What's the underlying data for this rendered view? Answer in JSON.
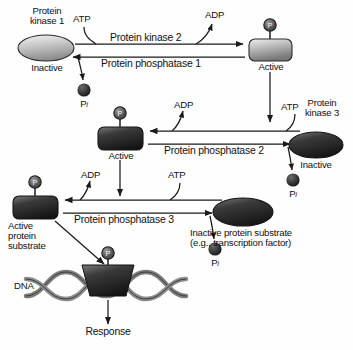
{
  "diagram": {
    "type": "signal-transduction-cascade",
    "background_color": "#fefefe",
    "ink_color": "#111111"
  },
  "nodes": {
    "kinase1_inactive": {
      "name": "Protein kinase 1",
      "name_line1": "Protein",
      "name_line2": "kinase 1",
      "state": "Inactive",
      "shape": "ellipse",
      "fill": "light-gray-gradient"
    },
    "kinase1_active": {
      "state": "Active",
      "shape": "rounded-rectangle",
      "fill": "gray-gradient",
      "phosphate_badge": "P"
    },
    "kinase2_active": {
      "state": "Active",
      "shape": "rounded-rectangle",
      "fill": "dark-gradient",
      "phosphate_badge": "P"
    },
    "kinase3_inactive": {
      "name": "Protein kinase 3",
      "name_line1": "Protein",
      "name_line2": "kinase 3",
      "state": "Inactive",
      "shape": "ellipse",
      "fill": "dark-gradient"
    },
    "substrate_active": {
      "state_line1": "Active",
      "state_line2": "protein",
      "state_line3": "substrate",
      "shape": "rounded-rectangle",
      "fill": "dark-gradient",
      "phosphate_badge": "P"
    },
    "substrate_inactive": {
      "label_line1": "Inactive protein substrate",
      "label_line2": "(e.g., transcription factor)",
      "shape": "ellipse",
      "fill": "dark-gradient"
    },
    "dna_complex": {
      "label": "DNA",
      "phosphate_badge": "P",
      "shape": "double-helix-with-bound-protein"
    }
  },
  "enzymes": {
    "kinase2": "Protein kinase 2",
    "phosphatase1": "Protein phosphatase 1",
    "phosphatase2": "Protein phosphatase 2",
    "phosphatase3": "Protein phosphatase 3"
  },
  "cofactors": {
    "atp": "ATP",
    "adp": "ADP",
    "pi_symbol": "P",
    "pi_subscript": "i"
  },
  "output": {
    "response": "Response"
  },
  "tiers": [
    {
      "index": 1,
      "forward_enzyme": "Protein kinase 2",
      "reverse_enzyme": "Protein phosphatase 1",
      "direction": "left-to-right",
      "consumes": "ATP",
      "releases": "ADP",
      "phosphatase_releases": "Pi"
    },
    {
      "index": 2,
      "forward_enzyme": "Protein kinase 3",
      "reverse_enzyme": "Protein phosphatase 2",
      "direction": "right-to-left",
      "consumes": "ATP",
      "releases": "ADP",
      "phosphatase_releases": "Pi"
    },
    {
      "index": 3,
      "forward_enzyme": "Protein kinase (substrate)",
      "reverse_enzyme": "Protein phosphatase 3",
      "direction": "right-to-left",
      "consumes": "ATP",
      "releases": "ADP",
      "phosphatase_releases": "Pi"
    }
  ]
}
